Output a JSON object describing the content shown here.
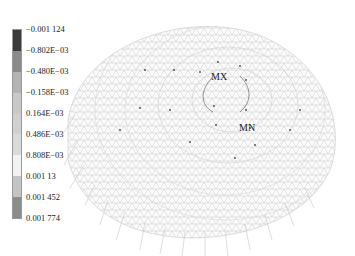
{
  "legend": {
    "labels": [
      "−0.001 124",
      "−0.802E−03",
      "−0.480E−03",
      "−0.158E−03",
      "0.164E−03",
      "0.486E−03",
      "0.808E−03",
      "0.001 13",
      "0.001 452",
      "0.001 774"
    ],
    "colors": [
      "#3a3a3a",
      "#8a8a8a",
      "#b4b4b4",
      "#c8c8c8",
      "#d0d0d0",
      "#dadada",
      "#f2f2f2",
      "#c4c4c4",
      "#8c8c8c"
    ]
  },
  "markers": {
    "max_label": "MX",
    "min_label": "MN"
  }
}
